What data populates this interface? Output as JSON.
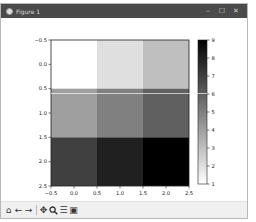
{
  "window": {
    "title": "Figure 1",
    "controls": {
      "minimize": "–",
      "maximize": "☐",
      "close": "✕"
    }
  },
  "toolbar": {
    "buttons": [
      {
        "name": "home",
        "icon": "home-icon",
        "glyph": "⌂"
      },
      {
        "name": "back",
        "icon": "arrow-left-icon",
        "glyph": "←"
      },
      {
        "name": "forward",
        "icon": "arrow-right-icon",
        "glyph": "→"
      },
      {
        "name": "pan",
        "icon": "pan-move-icon",
        "glyph": "✥"
      },
      {
        "name": "zoom",
        "icon": "zoom-magnifier-icon",
        "glyph": "🔍"
      },
      {
        "name": "configure",
        "icon": "configure-subplots-icon",
        "glyph": "☰"
      },
      {
        "name": "save",
        "icon": "save-floppy-icon",
        "glyph": "▣"
      }
    ]
  },
  "chart_data": {
    "type": "heatmap",
    "title": "",
    "xlabel": "",
    "ylabel": "",
    "colormap": "gray_r",
    "matrix": [
      [
        1,
        2,
        3
      ],
      [
        4,
        5,
        6
      ],
      [
        7,
        8,
        9
      ]
    ],
    "xlim": [
      -0.5,
      2.5
    ],
    "ylim": [
      2.5,
      -0.5
    ],
    "xticks": [
      -0.5,
      0.0,
      0.5,
      1.0,
      1.5,
      2.0,
      2.5
    ],
    "xtick_labels": [
      "−0.5",
      "0.0",
      "0.5",
      "1.0",
      "1.5",
      "2.0",
      "2.5"
    ],
    "yticks": [
      -0.5,
      0.0,
      0.5,
      1.0,
      1.5,
      2.0,
      2.5
    ],
    "ytick_labels": [
      "−0.5",
      "0.0",
      "0.5",
      "1.0",
      "1.5",
      "2.0",
      "2.5"
    ],
    "colorbar": {
      "range": [
        1,
        9
      ],
      "ticks": [
        1,
        2,
        3,
        4,
        5,
        6,
        7,
        8,
        9
      ],
      "tick_labels": [
        "1",
        "2",
        "3",
        "4",
        "5",
        "6",
        "7",
        "8",
        "9"
      ]
    },
    "cursor_line_y_value": 0.6,
    "grid": false
  }
}
